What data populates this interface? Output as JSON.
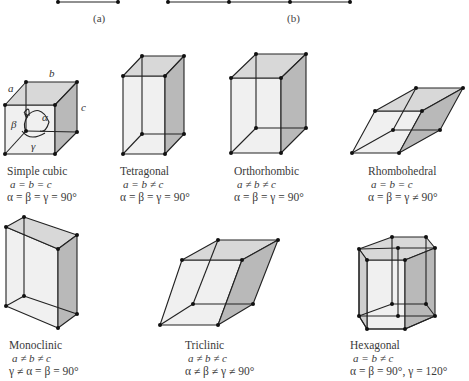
{
  "figure": {
    "top_captions": [
      {
        "id": "a",
        "label": "(a)"
      },
      {
        "id": "b",
        "label": "(b)"
      }
    ],
    "colors": {
      "edge": "#222222",
      "vertex": "#111111",
      "face_light": "#efefef",
      "face_mid": "#d9d9d9",
      "face_dark": "#b8b8b8",
      "background": "#ffffff"
    },
    "simple_cubic_axis_labels": {
      "a": "a",
      "b": "b",
      "c": "c",
      "alpha": "α",
      "beta": "β",
      "gamma": "γ"
    },
    "crystal_systems": [
      {
        "name": "Simple cubic",
        "lengths": "a = b = c",
        "angles": "α = β = γ = 90°"
      },
      {
        "name": "Tetragonal",
        "lengths": "a = b ≠ c",
        "angles": "α = β = γ = 90°"
      },
      {
        "name": "Orthorhombic",
        "lengths": "a ≠ b ≠ c",
        "angles": "α = β = γ = 90°"
      },
      {
        "name": "Rhombohedral",
        "lengths": "a = b = c",
        "angles": "α = β = γ ≠ 90°"
      },
      {
        "name": "Monoclinic",
        "lengths": "a ≠ b ≠ c",
        "angles": "γ ≠ α = β = 90°"
      },
      {
        "name": "Triclinic",
        "lengths": "a ≠ b ≠ c",
        "angles": "α ≠ β ≠ γ ≠ 90°"
      },
      {
        "name": "Hexagonal",
        "lengths": "a = b ≠ c",
        "angles": "α = β = 90°, γ = 120°"
      }
    ]
  }
}
